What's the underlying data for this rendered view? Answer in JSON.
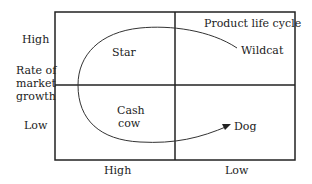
{
  "diagram": {
    "title": "Product life cycle",
    "y_axis": {
      "label_lines": [
        "Rate of",
        "market",
        "growth"
      ],
      "high": "High",
      "low": "Low"
    },
    "x_axis": {
      "high": "High",
      "low": "Low"
    },
    "quadrants": {
      "top_left": "Star",
      "top_right": "Wildcat",
      "bottom_left_lines": [
        "Cash",
        "cow"
      ],
      "bottom_right": "Dog"
    },
    "colors": {
      "line": "#222222",
      "background": "#ffffff"
    }
  }
}
